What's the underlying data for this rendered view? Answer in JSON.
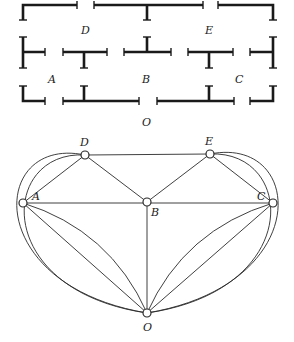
{
  "floor_plan": {
    "room_labels": [
      {
        "id": "D",
        "text": "D",
        "x": 85,
        "y": 30
      },
      {
        "id": "E",
        "text": "E",
        "x": 209,
        "y": 30
      },
      {
        "id": "A",
        "text": "A",
        "x": 52,
        "y": 79
      },
      {
        "id": "B",
        "text": "B",
        "x": 146,
        "y": 79
      },
      {
        "id": "C",
        "text": "C",
        "x": 239,
        "y": 79
      },
      {
        "id": "O",
        "text": "O",
        "x": 146,
        "y": 122
      }
    ]
  },
  "graph": {
    "nodes": [
      {
        "id": "D",
        "label": "D",
        "x": 85,
        "y": 155,
        "lx": 80,
        "ly": 146
      },
      {
        "id": "E",
        "label": "E",
        "x": 210,
        "y": 154,
        "lx": 205,
        "ly": 145
      },
      {
        "id": "A",
        "label": "A",
        "x": 23,
        "y": 203,
        "lx": 32,
        "ly": 199
      },
      {
        "id": "B",
        "label": "B",
        "x": 147,
        "y": 202,
        "lx": 151,
        "ly": 216
      },
      {
        "id": "C",
        "label": "C",
        "x": 273,
        "y": 203,
        "lx": 257,
        "ly": 199
      },
      {
        "id": "O",
        "label": "O",
        "x": 147,
        "y": 313,
        "lx": 143,
        "ly": 331
      }
    ],
    "edges": [
      [
        "D",
        "E"
      ],
      [
        "D",
        "A"
      ],
      [
        "D",
        "B"
      ],
      [
        "E",
        "B"
      ],
      [
        "E",
        "C"
      ],
      [
        "A",
        "B"
      ],
      [
        "B",
        "C"
      ],
      [
        "B",
        "O"
      ],
      [
        "A",
        "O"
      ],
      [
        "A",
        "O"
      ],
      [
        "C",
        "O"
      ],
      [
        "C",
        "O"
      ],
      [
        "D",
        "O"
      ],
      [
        "D",
        "O"
      ],
      [
        "E",
        "O"
      ],
      [
        "E",
        "O"
      ]
    ]
  }
}
